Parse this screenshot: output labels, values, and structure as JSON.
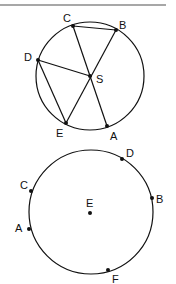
{
  "colors": {
    "stroke": "#111111",
    "rule": "#8a8a8a",
    "background": "#ffffff"
  },
  "figure1": {
    "description": "Circle with center S and points A-E on circumference; chords CB, DE and segments CA, BE, DS through S",
    "labels": {
      "A": "A",
      "B": "B",
      "C": "C",
      "D": "D",
      "E": "E",
      "S": "S"
    }
  },
  "figure2": {
    "description": "Circle with center E and points A, B, C, D, F on circumference",
    "labels": {
      "A": "A",
      "B": "B",
      "C": "C",
      "D": "D",
      "E": "E",
      "F": "F"
    }
  }
}
